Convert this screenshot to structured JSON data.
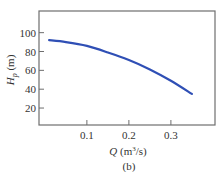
{
  "chart_data": {
    "type": "line",
    "title": "",
    "caption": "(b)",
    "xlabel": "Q (m³/s)",
    "ylabel": "H_p (m)",
    "xlim": [
      -0.014,
      0.405
    ],
    "ylim": [
      2,
      123
    ],
    "grid": false,
    "legend": null,
    "xticks": [
      0.1,
      0.2,
      0.3
    ],
    "xtick_labels": [
      "0.1",
      "0.2",
      "0.3"
    ],
    "yticks": [
      20,
      40,
      60,
      80,
      100
    ],
    "ytick_labels": [
      "20",
      "40",
      "60",
      "80",
      "100"
    ],
    "series": [
      {
        "name": "pump head curve",
        "color": "#2f4fb5",
        "x": [
          0.01,
          0.05,
          0.1,
          0.15,
          0.2,
          0.25,
          0.3,
          0.35
        ],
        "y": [
          92,
          90,
          86,
          79,
          71,
          61,
          49,
          35
        ]
      }
    ]
  },
  "labels": {
    "xlabel_q": "Q",
    "xlabel_units": " (m",
    "xlabel_sup": "3",
    "xlabel_tail": "/s)",
    "ylabel_h": "H",
    "ylabel_sub": "p",
    "ylabel_units": " (m)",
    "caption": "(b)"
  }
}
